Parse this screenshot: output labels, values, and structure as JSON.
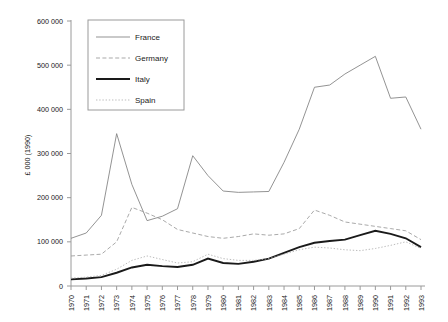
{
  "chart_data": {
    "type": "line",
    "title": "",
    "xlabel": "",
    "ylabel": "£ 000 (1990)",
    "grid": false,
    "legend_position": "top-left-inside",
    "xlim": [
      1970,
      1993
    ],
    "ylim": [
      0,
      600000
    ],
    "ytick_labels": [
      "0",
      "100 000",
      "200 000",
      "300 000",
      "400 000",
      "500 000",
      "600 000"
    ],
    "ytick_values": [
      0,
      100000,
      200000,
      300000,
      400000,
      500000,
      600000
    ],
    "x": [
      1970,
      1971,
      1972,
      1973,
      1974,
      1975,
      1976,
      1977,
      1978,
      1979,
      1980,
      1981,
      1982,
      1983,
      1984,
      1985,
      1986,
      1987,
      1988,
      1989,
      1990,
      1991,
      1992,
      1993
    ],
    "xtick_labels": [
      "1970",
      "1971",
      "1972",
      "1973",
      "1974",
      "1975",
      "1976",
      "1977",
      "1978",
      "1979",
      "1980",
      "1981",
      "1982",
      "1983",
      "1984",
      "1985",
      "1986",
      "1987",
      "1988",
      "1989",
      "1990",
      "1991",
      "1992",
      "1993"
    ],
    "series": [
      {
        "name": "France",
        "style": "solid-thin",
        "color": "#808080",
        "values": [
          108000,
          120000,
          160000,
          345000,
          230000,
          148000,
          158000,
          175000,
          295000,
          250000,
          215000,
          212000,
          213000,
          214000,
          280000,
          355000,
          450000,
          455000,
          480000,
          500000,
          520000,
          425000,
          428000,
          355000
        ]
      },
      {
        "name": "Germany",
        "style": "dashed",
        "color": "#9a9a9a",
        "values": [
          68000,
          70000,
          72000,
          100000,
          178000,
          165000,
          150000,
          128000,
          120000,
          112000,
          108000,
          112000,
          118000,
          115000,
          118000,
          130000,
          172000,
          160000,
          145000,
          140000,
          135000,
          130000,
          125000,
          105000
        ]
      },
      {
        "name": "Italy",
        "style": "solid-thick",
        "color": "#1a1a1a",
        "values": [
          15000,
          17000,
          20000,
          30000,
          42000,
          48000,
          45000,
          43000,
          48000,
          62000,
          52000,
          50000,
          55000,
          62000,
          75000,
          88000,
          98000,
          102000,
          105000,
          115000,
          125000,
          118000,
          108000,
          88000
        ]
      },
      {
        "name": "Spain",
        "style": "dotted",
        "color": "#b0b0b0",
        "values": [
          18000,
          20000,
          24000,
          38000,
          58000,
          68000,
          60000,
          52000,
          55000,
          72000,
          62000,
          58000,
          58000,
          62000,
          72000,
          82000,
          88000,
          86000,
          82000,
          80000,
          85000,
          92000,
          100000,
          85000
        ]
      }
    ]
  },
  "legend": {
    "entries": [
      {
        "label": "France"
      },
      {
        "label": "Germany"
      },
      {
        "label": "Italy"
      },
      {
        "label": "Spain"
      }
    ]
  }
}
